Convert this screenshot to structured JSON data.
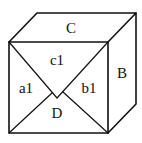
{
  "diagram": {
    "type": "cube-with-folded-face",
    "colors": {
      "stroke": "#111111",
      "background": "#ffffff"
    },
    "vertices": {
      "front_top_left": [
        9,
        42
      ],
      "front_top_right": [
        108,
        42
      ],
      "front_bottom_left": [
        9,
        133
      ],
      "front_bottom_right": [
        108,
        133
      ],
      "back_top_left": [
        37,
        13
      ],
      "back_top_right": [
        136,
        13
      ],
      "back_bottom_right": [
        136,
        104
      ],
      "fold_apex": [
        57,
        98
      ],
      "left_junction": [
        52,
        93
      ],
      "right_junction": [
        63,
        92
      ]
    },
    "labels": {
      "top_face": "C",
      "right_face": "B",
      "front_top_triangle": "c1",
      "front_left_triangle": "a1",
      "front_right_triangle": "b1",
      "front_bottom_triangle": "D"
    }
  }
}
